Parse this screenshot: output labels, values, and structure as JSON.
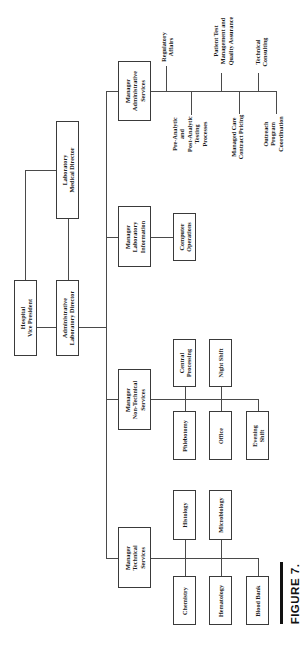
{
  "figure": {
    "caption": "FIGURE 7.",
    "orientation": "rotated 90° counter-clockwise"
  },
  "org_chart": {
    "hospital_vp": [
      "Hospital",
      "Vice President"
    ],
    "lab_medical_director": [
      "Laboratory",
      "Medical Director"
    ],
    "admin_lab_director": [
      "Administrative",
      "Laboratory Director"
    ],
    "managers": {
      "administrative": {
        "title": [
          "Manager",
          "Administrative",
          "Services"
        ],
        "reports": {
          "regulatory": [
            "Regulatory",
            "Affairs"
          ],
          "pre_post_analytic": [
            "Pre-Analytic",
            "and",
            "Post-Analytic",
            "Testing",
            "Processes"
          ],
          "patient_test": [
            "Patient Test",
            "Management and",
            "Quality Assurance"
          ],
          "managed_care": [
            "Managed Care",
            "Contract Pricing"
          ],
          "technical_consulting": [
            "Technical",
            "Consulting"
          ],
          "outreach": [
            "Outreach",
            "Program",
            "Coordination"
          ]
        }
      },
      "lab_information": {
        "title": [
          "Manager",
          "Laboratory",
          "Information"
        ],
        "reports": {
          "computer_operations": [
            "Computer",
            "Operations"
          ]
        }
      },
      "non_technical": {
        "title": [
          "Manager",
          "Non-Technical",
          "Services"
        ],
        "reports": {
          "central_processing": [
            "Central",
            "Processing"
          ],
          "night_shift": [
            "Night Shift"
          ],
          "phlebotomy": [
            "Phlebotomy"
          ],
          "office": [
            "Office"
          ],
          "evening_shift": [
            "Evening",
            "Shift"
          ]
        }
      },
      "technical": {
        "title": [
          "Manager",
          "Technical",
          "Services"
        ],
        "reports": {
          "histology": [
            "Histology"
          ],
          "microbiology": [
            "Microbiology"
          ],
          "chemistry": [
            "Chemistry"
          ],
          "hematology": [
            "Hematology"
          ],
          "blood_bank": [
            "Blood Bank"
          ]
        }
      }
    }
  }
}
